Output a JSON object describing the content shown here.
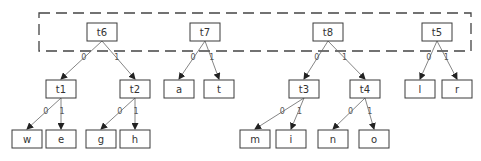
{
  "diagram": {
    "type": "huffman-forest",
    "group_box": {
      "x": 39,
      "y": 13,
      "w": 432,
      "h": 38,
      "style": "dashed",
      "contains": [
        "t6",
        "t7",
        "t8",
        "t5"
      ]
    },
    "nodes": [
      {
        "id": "t6",
        "label": "t6",
        "x": 87,
        "y": 23,
        "w": 30,
        "h": 18
      },
      {
        "id": "t7",
        "label": "t7",
        "x": 190,
        "y": 23,
        "w": 30,
        "h": 18
      },
      {
        "id": "t8",
        "label": "t8",
        "x": 313,
        "y": 23,
        "w": 30,
        "h": 18
      },
      {
        "id": "t5",
        "label": "t5",
        "x": 422,
        "y": 23,
        "w": 30,
        "h": 18
      },
      {
        "id": "t1",
        "label": "t1",
        "x": 46,
        "y": 80,
        "w": 30,
        "h": 18
      },
      {
        "id": "t2",
        "label": "t2",
        "x": 120,
        "y": 80,
        "w": 30,
        "h": 18
      },
      {
        "id": "a",
        "label": "a",
        "x": 164,
        "y": 80,
        "w": 30,
        "h": 18
      },
      {
        "id": "t",
        "label": "t",
        "x": 204,
        "y": 80,
        "w": 30,
        "h": 18
      },
      {
        "id": "t3",
        "label": "t3",
        "x": 289,
        "y": 80,
        "w": 30,
        "h": 18
      },
      {
        "id": "t4",
        "label": "t4",
        "x": 350,
        "y": 80,
        "w": 30,
        "h": 18
      },
      {
        "id": "l",
        "label": "l",
        "x": 405,
        "y": 80,
        "w": 30,
        "h": 18
      },
      {
        "id": "r",
        "label": "r",
        "x": 442,
        "y": 80,
        "w": 30,
        "h": 18
      },
      {
        "id": "w",
        "label": "w",
        "x": 12,
        "y": 130,
        "w": 30,
        "h": 18
      },
      {
        "id": "e",
        "label": "e",
        "x": 46,
        "y": 130,
        "w": 30,
        "h": 18
      },
      {
        "id": "g",
        "label": "g",
        "x": 86,
        "y": 130,
        "w": 30,
        "h": 18
      },
      {
        "id": "h",
        "label": "h",
        "x": 120,
        "y": 130,
        "w": 30,
        "h": 18
      },
      {
        "id": "m",
        "label": "m",
        "x": 240,
        "y": 130,
        "w": 30,
        "h": 18
      },
      {
        "id": "i",
        "label": "i",
        "x": 276,
        "y": 130,
        "w": 30,
        "h": 18
      },
      {
        "id": "n",
        "label": "n",
        "x": 318,
        "y": 130,
        "w": 30,
        "h": 18
      },
      {
        "id": "o",
        "label": "o",
        "x": 359,
        "y": 130,
        "w": 30,
        "h": 18
      }
    ],
    "edges": [
      {
        "from": "t6",
        "to": "t1",
        "label": "0"
      },
      {
        "from": "t6",
        "to": "t2",
        "label": "1"
      },
      {
        "from": "t7",
        "to": "a",
        "label": "0"
      },
      {
        "from": "t7",
        "to": "t",
        "label": "1"
      },
      {
        "from": "t8",
        "to": "t3",
        "label": "0"
      },
      {
        "from": "t8",
        "to": "t4",
        "label": "1"
      },
      {
        "from": "t5",
        "to": "l",
        "label": "0"
      },
      {
        "from": "t5",
        "to": "r",
        "label": "1"
      },
      {
        "from": "t1",
        "to": "w",
        "label": "0"
      },
      {
        "from": "t1",
        "to": "e",
        "label": "1"
      },
      {
        "from": "t2",
        "to": "g",
        "label": "0"
      },
      {
        "from": "t2",
        "to": "h",
        "label": "1"
      },
      {
        "from": "t3",
        "to": "m",
        "label": "0"
      },
      {
        "from": "t3",
        "to": "i",
        "label": "1"
      },
      {
        "from": "t4",
        "to": "n",
        "label": "0"
      },
      {
        "from": "t4",
        "to": "o",
        "label": "1"
      }
    ]
  }
}
